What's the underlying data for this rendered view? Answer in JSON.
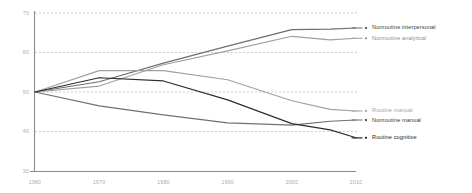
{
  "chart_data": {
    "type": "line",
    "title": "",
    "subtitle": "",
    "xlabel": "",
    "ylabel": "",
    "x": [
      1960,
      1970,
      1980,
      1990,
      2000,
      2006,
      2010
    ],
    "xlim": [
      1960,
      2010
    ],
    "ylim": [
      30,
      70
    ],
    "xticks": [
      "1960",
      "1970",
      "1980",
      "1990",
      "2000",
      "2010"
    ],
    "xtick_values": [
      1960,
      1970,
      1980,
      1990,
      2000,
      2010
    ],
    "yticks": [
      "70",
      "60",
      "50",
      "40",
      "30"
    ],
    "ytick_values": [
      70,
      60,
      50,
      40,
      30
    ],
    "grid": "horizontal-dashed",
    "legend_position": "right-inline",
    "series": [
      {
        "name": "Nonroutine interpersonal",
        "color": "#6e6e6e",
        "values": [
          50,
          52.6,
          57.3,
          61.6,
          65.8,
          65.9,
          66.2
        ],
        "label_y": 66.2
      },
      {
        "name": "Nonroutine analytical",
        "color": "#a0a0a0",
        "values": [
          50,
          51.5,
          56.9,
          60.4,
          64.1,
          63.2,
          63.6
        ],
        "label_y": 63.6
      },
      {
        "name": "Routine manual",
        "color": "#a0a0a0",
        "values": [
          50,
          55.4,
          55.4,
          53.1,
          47.8,
          45.6,
          45.2
        ],
        "label_y": 45.2
      },
      {
        "name": "Nonroutine manual",
        "color": "#707070",
        "values": [
          50,
          46.5,
          44.2,
          42.2,
          41.6,
          42.6,
          42.9
        ],
        "label_y": 42.9
      },
      {
        "name": "Routine cognitive",
        "color": "#2d2d2d",
        "values": [
          50,
          53.6,
          52.8,
          48.0,
          42.0,
          40.4,
          38.4
        ],
        "label_y": 38.4
      }
    ]
  },
  "legend": {
    "items": [
      {
        "label": "Nonroutine interpersonal",
        "color": "#6e6e6e",
        "text_color": "#3a3a3a"
      },
      {
        "label": "Nonroutine analytical",
        "color": "#a0a0a0",
        "text_color": "#8c8c8c"
      },
      {
        "label": "Routine manual",
        "color": "#a0a0a0",
        "text_color": "#a3a3a3"
      },
      {
        "label": "Nonroutine manual",
        "color": "#707070",
        "text_color": "#333333"
      },
      {
        "label": "Routine cognitive",
        "color": "#2d2d2d",
        "text_color": "#1c1c1c"
      }
    ]
  },
  "axes": {
    "y_labels": [
      "70",
      "60",
      "50",
      "40",
      "30"
    ],
    "x_labels": [
      "1960",
      "1970",
      "1980",
      "1990",
      "2000",
      "2010"
    ]
  },
  "colors": {
    "background": "#ffffff",
    "axis": "#8a8a8a",
    "grid": "#c9b6b8",
    "tick_text": "#b0a8a8"
  }
}
